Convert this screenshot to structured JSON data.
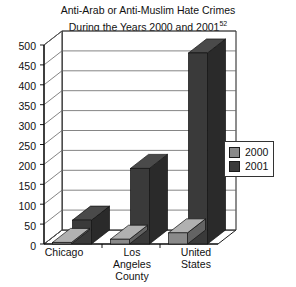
{
  "chart_data": {
    "type": "bar",
    "title": "Anti-Arab or Anti-Muslim Hate Crimes During the Years 2000 and 2001",
    "title_line1": "Anti-Arab or Anti-Muslim Hate Crimes",
    "title_line2": "During the Years 2000 and 2001",
    "title_footnote": "52",
    "xlabel": "",
    "ylabel": "",
    "ylim": [
      0,
      500
    ],
    "ytick_step": 50,
    "yticks": [
      "500",
      "450",
      "400",
      "350",
      "300",
      "250",
      "200",
      "150",
      "100",
      "50",
      "0"
    ],
    "grid": true,
    "legend_position": "right",
    "categories": [
      "Chicago",
      "Los Angeles County",
      "United States"
    ],
    "category_lines": [
      [
        "Chicago"
      ],
      [
        "Los",
        "Angeles",
        "County"
      ],
      [
        "United",
        "States"
      ]
    ],
    "series": [
      {
        "name": "2000",
        "color": "#808080",
        "values": [
          4,
          12,
          28
        ]
      },
      {
        "name": "2001",
        "color": "#383838",
        "values": [
          60,
          190,
          480
        ]
      }
    ]
  },
  "legend": {
    "entries": [
      {
        "label": "2000",
        "color": "#8a8a8a"
      },
      {
        "label": "2001",
        "color": "#3a3a3a"
      }
    ]
  },
  "colors": {
    "series_2000": "#8a8a8a",
    "series_2001": "#3a3a3a",
    "axis": "#000000",
    "grid": "#555555",
    "plot_background": "#ffffff"
  }
}
